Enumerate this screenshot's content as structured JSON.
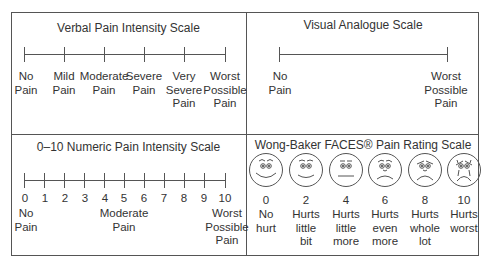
{
  "panels": {
    "verbal": {
      "title": "Verbal Pain Intensity Scale",
      "labels": [
        "No\nPain",
        "Mild\nPain",
        "Moderate\nPain",
        "Severe\nPain",
        "Very\nSevere\nPain",
        "Worst\nPossible\nPain"
      ]
    },
    "visual": {
      "title": "Visual Analogue Scale",
      "left_label": "No\nPain",
      "right_label": "Worst\nPossible\nPain"
    },
    "numeric": {
      "title": "0–10 Numeric Pain Intensity Scale",
      "numbers": [
        "0",
        "1",
        "2",
        "3",
        "4",
        "5",
        "6",
        "7",
        "8",
        "9",
        "10"
      ],
      "left_label": "No\nPain",
      "middle_label": "Moderate\nPain",
      "right_label": "Worst\nPossible\nPain"
    },
    "faces": {
      "title": "Wong-Baker FACES® Pain Rating Scale",
      "items": [
        {
          "score": "0",
          "label": "No\nhurt",
          "icon": "smiling-face-icon"
        },
        {
          "score": "2",
          "label": "Hurts\nlittle\nbit",
          "icon": "slight-smile-face-icon"
        },
        {
          "score": "4",
          "label": "Hurts\nlittle\nmore",
          "icon": "neutral-face-icon"
        },
        {
          "score": "6",
          "label": "Hurts\neven\nmore",
          "icon": "frown-face-icon"
        },
        {
          "score": "8",
          "label": "Hurts\nwhole\nlot",
          "icon": "sad-face-icon"
        },
        {
          "score": "10",
          "label": "Hurts\nworst",
          "icon": "crying-face-icon"
        }
      ]
    }
  }
}
